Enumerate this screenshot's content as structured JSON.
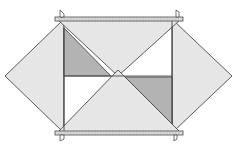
{
  "diagram": {
    "title": "",
    "width": 235,
    "height": 155,
    "colors": {
      "background": "#ffffff",
      "light_fill": "#e6e6e6",
      "dark_fill": "#b3b3b3",
      "white_fill": "#ffffff",
      "stroke": "#4a4a4a",
      "bar_fill": "#dcdcdc"
    },
    "shapes": [
      {
        "name": "left-diamond",
        "type": "polygon",
        "points": "5,76 62,21 64,21 64,131 62,131",
        "fill": "light_fill"
      },
      {
        "name": "right-diamond",
        "type": "polygon",
        "points": "232,76 174,21 172,21 172,131 174,131",
        "fill": "light_fill"
      },
      {
        "name": "center-white-square",
        "type": "polygon",
        "points": "64,21 172,21 172,131 64,131",
        "fill": "white_fill"
      },
      {
        "name": "upper-left-gray-triangle",
        "type": "polygon",
        "points": "64,28 64,76 111,76",
        "fill": "dark_fill"
      },
      {
        "name": "lower-right-gray-triangle",
        "type": "polygon",
        "points": "125,77 172,77 172,124",
        "fill": "dark_fill"
      },
      {
        "name": "top-inverted-triangle",
        "type": "polygon",
        "points": "58,20 180,20 118,76",
        "fill": "light_fill"
      },
      {
        "name": "bottom-triangle",
        "type": "polygon",
        "points": "118,70 58,132 180,132",
        "fill": "light_fill"
      }
    ],
    "lines": [
      {
        "name": "middle-horizontal-line",
        "x1": 64,
        "y1": 76,
        "x2": 172,
        "y2": 76
      },
      {
        "name": "left-vertical-line",
        "x1": 64,
        "y1": 28,
        "x2": 64,
        "y2": 131
      },
      {
        "name": "right-vertical-line",
        "x1": 172,
        "y1": 21,
        "x2": 172,
        "y2": 124
      }
    ],
    "bars": [
      {
        "name": "top-bar",
        "x": 55,
        "y": 17,
        "width": 128,
        "height": 4
      },
      {
        "name": "bottom-bar",
        "x": 55,
        "y": 131,
        "width": 128,
        "height": 4
      }
    ],
    "tabs": [
      {
        "name": "top-left-tab",
        "points": "60,17 60,10 64,14 64,17"
      },
      {
        "name": "top-right-tab",
        "points": "176,17 176,10 179,12 179,17"
      },
      {
        "name": "bottom-left-tab",
        "points": "60,135 60,141 64,139 64,135"
      },
      {
        "name": "bottom-right-tab",
        "points": "174,135 174,141 177,139 177,135"
      }
    ]
  }
}
